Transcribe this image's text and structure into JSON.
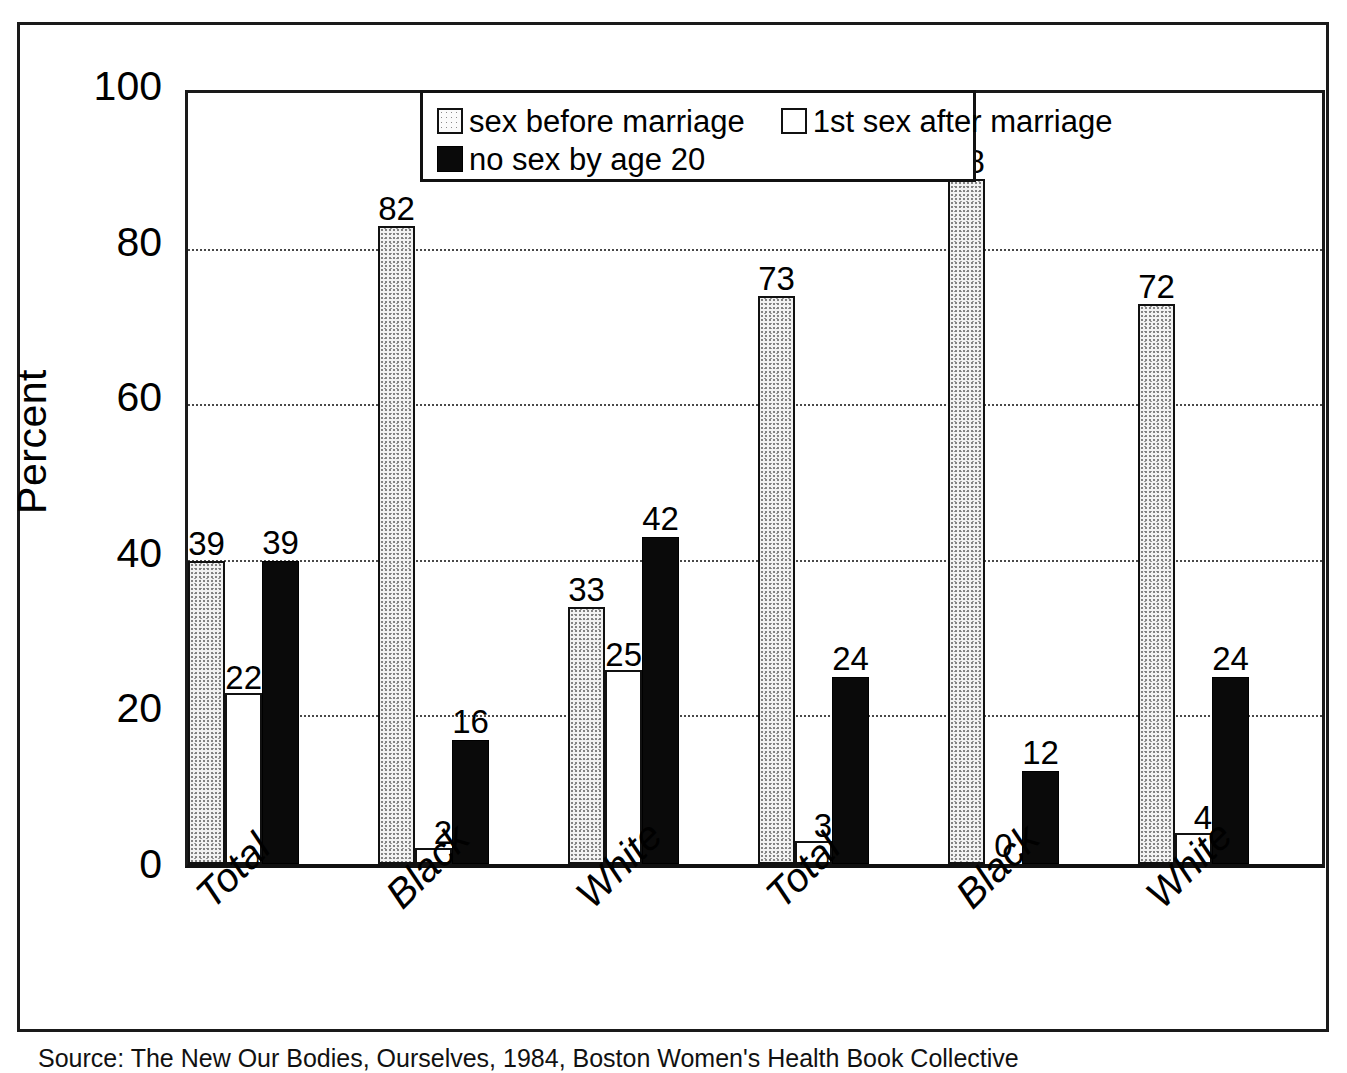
{
  "figure": {
    "caption": "Source: The New Our Bodies, Ourselves, 1984, Boston Women's Health Book Collective"
  },
  "legend": {
    "position": "top-center-inside",
    "rows": [
      [
        {
          "label": "sex before marriage",
          "swatch": "stipple-swatch-icon",
          "style": "series-stipple"
        },
        {
          "label": "1st sex after marriage",
          "swatch": "white-swatch-icon",
          "style": "series-white"
        }
      ],
      [
        {
          "label": "no sex by age 20",
          "swatch": "black-swatch-icon",
          "style": "series-black"
        }
      ]
    ]
  },
  "chart_data": {
    "type": "bar",
    "title": "",
    "subtitle": "",
    "xlabel": "",
    "ylabel": "Percent",
    "ylim": [
      0,
      100
    ],
    "yticks": [
      0,
      20,
      40,
      60,
      80,
      100
    ],
    "ytick_labels": [
      "0",
      "20",
      "40",
      "60",
      "80",
      "100"
    ],
    "grid": true,
    "grid_axis": "y",
    "grid_style": "dotted",
    "legend_position": "top-center-inside",
    "categories": [
      "Total",
      "Black",
      "White",
      "Total",
      "Black",
      "White"
    ],
    "series": [
      {
        "name": "sex before marriage",
        "style": "series-stipple",
        "values": [
          39,
          82,
          33,
          73,
          88,
          72
        ]
      },
      {
        "name": "1st sex after marriage",
        "style": "series-white",
        "values": [
          22,
          2,
          25,
          3,
          0,
          4
        ]
      },
      {
        "name": "no sex by age 20",
        "style": "series-black",
        "values": [
          39,
          16,
          42,
          24,
          12,
          24
        ]
      }
    ]
  }
}
